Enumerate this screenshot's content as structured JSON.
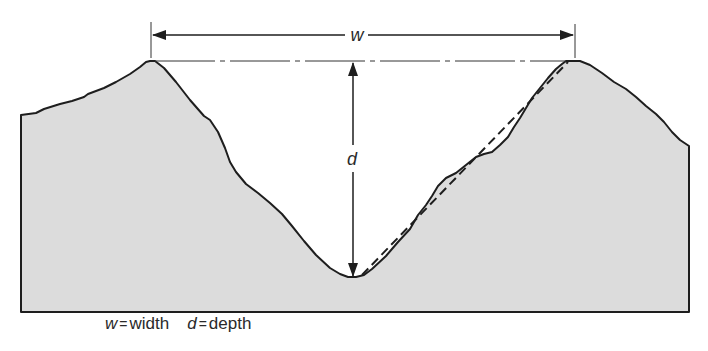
{
  "diagram": {
    "type": "valley-cross-section",
    "labels": {
      "width_symbol": "w",
      "depth_symbol": "d"
    },
    "legend": [
      {
        "symbol": "w",
        "equals": "=",
        "meaning": "width"
      },
      {
        "symbol": "d",
        "equals": "=",
        "meaning": "depth"
      }
    ],
    "colors": {
      "ground_fill": "#dcdcdc",
      "outline": "#1e1e1e",
      "background": "#ffffff"
    }
  }
}
